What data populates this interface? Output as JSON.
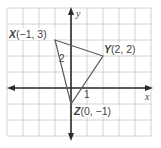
{
  "figure": {
    "type": "coordinate-plane-triangle",
    "axes": {
      "x_label": "x",
      "y_label": "y",
      "x_range": [
        -4,
        5
      ],
      "y_range": [
        -3,
        5
      ]
    },
    "grid": {
      "unit_px": 16,
      "origin_px": [
        71,
        88
      ]
    },
    "vertices": [
      {
        "name": "X",
        "coords": "(−1, 3)",
        "x": -1,
        "y": 3
      },
      {
        "name": "Y",
        "coords": "(2, 2)",
        "x": 2,
        "y": 2
      },
      {
        "name": "Z",
        "coords": "(0, −1)",
        "x": 0,
        "y": -1
      }
    ],
    "tick_labels": {
      "y_two": "2",
      "x_one": "1"
    },
    "colors": {
      "grid": "#c9c9c9",
      "axes": "#2b2b2b",
      "triangle": "#5a5a5a",
      "text": "#3f3f3f"
    }
  }
}
